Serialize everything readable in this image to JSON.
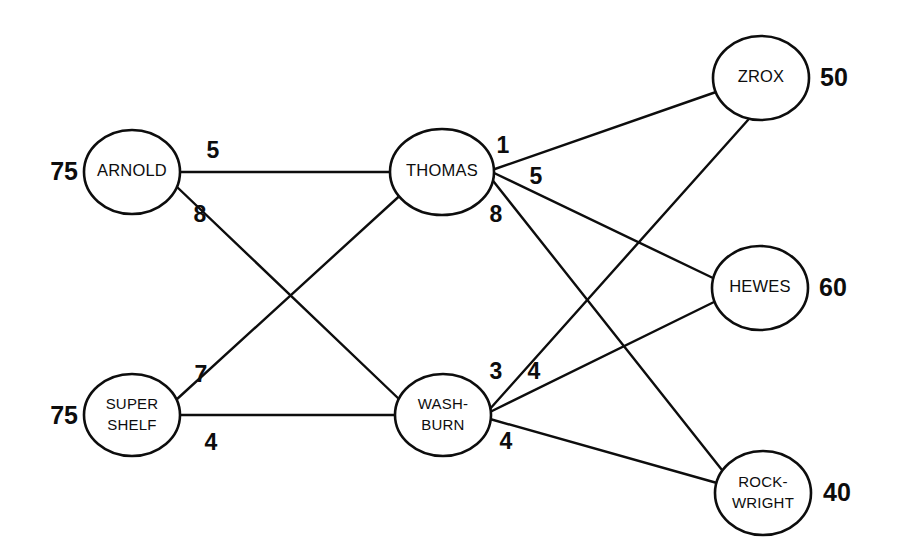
{
  "diagram": {
    "type": "network-flow-diagram",
    "line_color": "#0d0d0d",
    "node_fill": "#ffffff",
    "background": "#ffffff"
  },
  "nodes": [
    {
      "id": "arnold",
      "label": "ARNOLD",
      "label_lines": [
        "ARNOLD"
      ],
      "value": "75",
      "value_side": "left",
      "cx": 132,
      "cy": 172,
      "rx": 48,
      "ry": 42,
      "value_x": 78,
      "value_y": 173
    },
    {
      "id": "supershelf",
      "label": "SUPER SHELF",
      "label_lines": [
        "SUPER",
        "SHELF"
      ],
      "value": "75",
      "value_side": "left",
      "cx": 132,
      "cy": 415,
      "rx": 48,
      "ry": 41,
      "value_x": 78,
      "value_y": 417
    },
    {
      "id": "thomas",
      "label": "THOMAS",
      "label_lines": [
        "THOMAS"
      ],
      "value": "",
      "value_side": "none",
      "cx": 442,
      "cy": 172,
      "rx": 52,
      "ry": 43,
      "value_x": 0,
      "value_y": 0
    },
    {
      "id": "washburn",
      "label": "WASH-BURN",
      "label_lines": [
        "WASH-",
        "BURN"
      ],
      "value": "",
      "value_side": "none",
      "cx": 443,
      "cy": 415,
      "rx": 48,
      "ry": 41,
      "value_x": 0,
      "value_y": 0
    },
    {
      "id": "zrox",
      "label": "ZROX",
      "label_lines": [
        "ZROX"
      ],
      "value": "50",
      "value_side": "right",
      "cx": 761,
      "cy": 78,
      "rx": 48,
      "ry": 42,
      "value_x": 820,
      "value_y": 79
    },
    {
      "id": "hewes",
      "label": "HEWES",
      "label_lines": [
        "HEWES"
      ],
      "value": "60",
      "value_side": "right",
      "cx": 760,
      "cy": 288,
      "rx": 48,
      "ry": 42,
      "value_x": 819,
      "value_y": 289
    },
    {
      "id": "rockwright",
      "label": "ROCK-WRIGHT",
      "label_lines": [
        "ROCK-",
        "WRIGHT"
      ],
      "value": "40",
      "value_side": "right",
      "cx": 763,
      "cy": 493,
      "rx": 48,
      "ry": 42,
      "value_x": 823,
      "value_y": 494
    }
  ],
  "edges": [
    {
      "id": "arnold-thomas",
      "from": "ARNOLD",
      "to": "THOMAS",
      "weight": "5",
      "x1": 180,
      "y1": 172,
      "x2": 390,
      "y2": 172,
      "label_x": 213,
      "label_y": 152
    },
    {
      "id": "arnold-washburn",
      "from": "ARNOLD",
      "to": "WASH-BURN",
      "weight": "8",
      "x1": 176,
      "y1": 186,
      "x2": 400,
      "y2": 400,
      "label_x": 200,
      "label_y": 216
    },
    {
      "id": "supershelf-thomas",
      "from": "SUPER SHELF",
      "to": "THOMAS",
      "weight": "7",
      "x1": 176,
      "y1": 400,
      "x2": 406,
      "y2": 190,
      "label_x": 201,
      "label_y": 376
    },
    {
      "id": "supershelf-washburn",
      "from": "SUPER SHELF",
      "to": "WASH-BURN",
      "weight": "4",
      "x1": 180,
      "y1": 415,
      "x2": 395,
      "y2": 415,
      "label_x": 211,
      "label_y": 444
    },
    {
      "id": "thomas-zrox",
      "from": "THOMAS",
      "to": "ZROX",
      "weight": "1",
      "x1": 492,
      "y1": 170,
      "x2": 716,
      "y2": 92,
      "label_x": 503,
      "label_y": 147
    },
    {
      "id": "thomas-hewes",
      "from": "THOMAS",
      "to": "HEWES",
      "weight": "5",
      "x1": 492,
      "y1": 172,
      "x2": 713,
      "y2": 278,
      "label_x": 536,
      "label_y": 178
    },
    {
      "id": "thomas-rockwright",
      "from": "THOMAS",
      "to": "ROCK-WRIGHT",
      "weight": "8",
      "x1": 490,
      "y1": 177,
      "x2": 722,
      "y2": 470,
      "label_x": 496,
      "label_y": 216
    },
    {
      "id": "washburn-zrox",
      "from": "WASH-BURN",
      "to": "ZROX",
      "weight": "3",
      "x1": 489,
      "y1": 410,
      "x2": 748,
      "y2": 120,
      "label_x": 496,
      "label_y": 373
    },
    {
      "id": "washburn-hewes",
      "from": "WASH-BURN",
      "to": "HEWES",
      "weight": "4",
      "x1": 490,
      "y1": 412,
      "x2": 714,
      "y2": 302,
      "label_x": 534,
      "label_y": 373
    },
    {
      "id": "washburn-rockwright",
      "from": "WASH-BURN",
      "to": "ROCK-WRIGHT",
      "weight": "4",
      "x1": 490,
      "y1": 419,
      "x2": 717,
      "y2": 483,
      "label_x": 506,
      "label_y": 443
    }
  ]
}
